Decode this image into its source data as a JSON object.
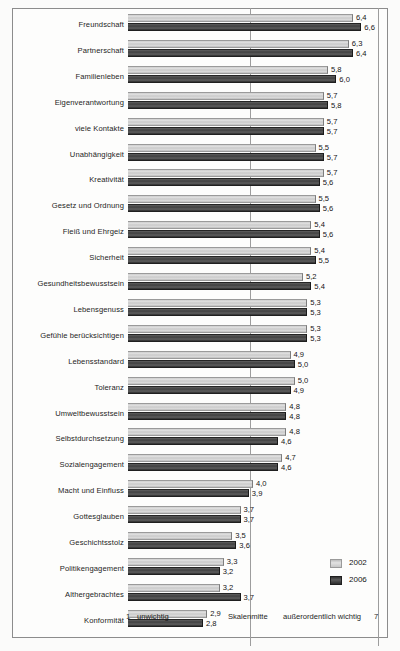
{
  "chart_data": {
    "type": "bar",
    "orientation": "horizontal",
    "title": "",
    "xlabel": "",
    "ylabel": "",
    "xlim": [
      1,
      7
    ],
    "grid": true,
    "gridlines": [
      "Skalenmitte",
      "7"
    ],
    "legend_position": "bottom-right",
    "axis_caption": {
      "min_tick": "1",
      "min_label": "unwichtig",
      "mid_label": "Skalenmitte",
      "max_label": "außerordentlich wichtig",
      "max_tick": "7"
    },
    "legend": [
      {
        "name": "2002",
        "color": "#cccccc"
      },
      {
        "name": "2006",
        "color": "#3c3c3c"
      }
    ],
    "categories": [
      "Freundschaft",
      "Partnerschaft",
      "Familienleben",
      "Eigenverantwortung",
      "viele Kontakte",
      "Unabhängigkeit",
      "Kreativität",
      "Gesetz und Ordnung",
      "Fleiß und Ehrgeiz",
      "Sicherheit",
      "Gesundheitsbewusstsein",
      "Lebensgenuss",
      "Gefühle berücksichtigen",
      "Lebensstandard",
      "Toleranz",
      "Umweltbewusstsein",
      "Selbstdurchsetzung",
      "Sozialengagement",
      "Macht und Einfluss",
      "Gottesglauben",
      "Geschichtsstolz",
      "Politikengagement",
      "Althergebrachtes",
      "Konformität"
    ],
    "series": [
      {
        "name": "2002",
        "values": [
          6.4,
          6.3,
          5.8,
          5.7,
          5.7,
          5.5,
          5.7,
          5.5,
          5.4,
          5.4,
          5.2,
          5.3,
          5.3,
          4.9,
          5.0,
          4.8,
          4.8,
          4.7,
          4.0,
          3.7,
          3.5,
          3.3,
          3.2,
          2.9
        ],
        "labels": [
          "6,4",
          "6,3",
          "5,8",
          "5,7",
          "5,7",
          "5,5",
          "5,7",
          "5,5",
          "5,4",
          "5,4",
          "5,2",
          "5,3",
          "5,3",
          "4,9",
          "5,0",
          "4,8",
          "4,8",
          "4,7",
          "4,0",
          "3,7",
          "3,5",
          "3,3",
          "3,2",
          "2,9"
        ]
      },
      {
        "name": "2006",
        "values": [
          6.6,
          6.4,
          6.0,
          5.8,
          5.7,
          5.7,
          5.6,
          5.6,
          5.6,
          5.5,
          5.4,
          5.3,
          5.3,
          5.0,
          4.9,
          4.8,
          4.6,
          4.6,
          3.9,
          3.7,
          3.6,
          3.2,
          3.7,
          2.8
        ],
        "labels": [
          "6,6",
          "6,4",
          "6,0",
          "5,8",
          "5,7",
          "5,7",
          "5,6",
          "5,6",
          "5,6",
          "5,5",
          "5,4",
          "5,3",
          "5,3",
          "5,0",
          "4,9",
          "4,8",
          "4,6",
          "4,6",
          "3,9",
          "3,7",
          "3,6",
          "3,2",
          "3,7",
          "2,8"
        ]
      }
    ]
  }
}
